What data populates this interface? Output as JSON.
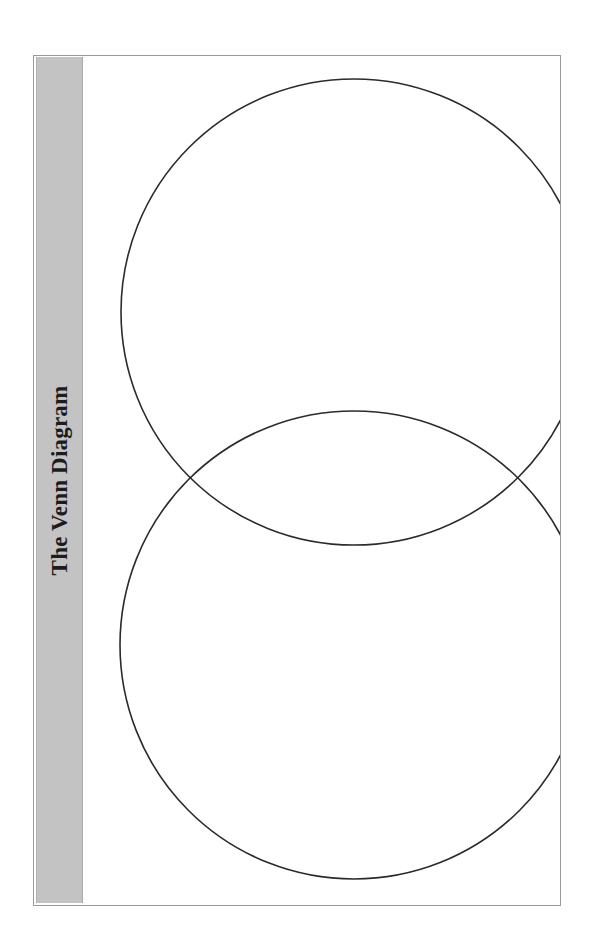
{
  "worksheet": {
    "title": "The Venn Diagram",
    "background_color": "#ffffff",
    "page_border_color": "#9a9a9a",
    "band_color": "#c3c3c3",
    "stroke_color": "#2b2b2b"
  },
  "title_band": {
    "label": "The Venn Diagram",
    "orientation": "vertical-bottom-to-top"
  },
  "diagram": {
    "type": "venn",
    "set_count": 2,
    "circles": [
      {
        "name": "top-circle",
        "cx": 271,
        "cy": 256,
        "r": 233
      },
      {
        "name": "bottom-circle",
        "cx": 271,
        "cy": 589,
        "r": 234
      }
    ],
    "intersections": [
      {
        "name": "left-intersection",
        "x": 116,
        "y": 423
      },
      {
        "name": "right-intersection",
        "x": 429,
        "y": 423
      }
    ],
    "labels": []
  }
}
